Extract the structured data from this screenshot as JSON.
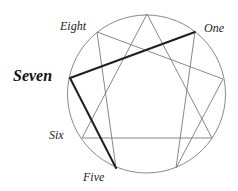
{
  "diagram": {
    "type": "enneagram",
    "circle": {
      "cx": 146.5,
      "cy": 94,
      "r": 79
    },
    "colors": {
      "thin_line": "#7a7a7a",
      "bold_line": "#1e1e1e",
      "circle": "#8a8a8a"
    },
    "points": {
      "nine": [
        147,
        14
      ],
      "one": [
        195,
        32
      ],
      "two": [
        223,
        79
      ],
      "three": [
        212,
        138
      ],
      "four": [
        176,
        168
      ],
      "five": [
        116,
        168
      ],
      "six": [
        82,
        138
      ],
      "seven": [
        70,
        78
      ],
      "eight": [
        97,
        32
      ]
    },
    "labels": {
      "eight": "Eight",
      "one": "One",
      "seven": "Seven",
      "six": "Six",
      "five": "Five"
    },
    "highlighted_point": "seven",
    "bold_edges": [
      [
        "seven",
        "one"
      ],
      [
        "seven",
        "five"
      ]
    ]
  }
}
